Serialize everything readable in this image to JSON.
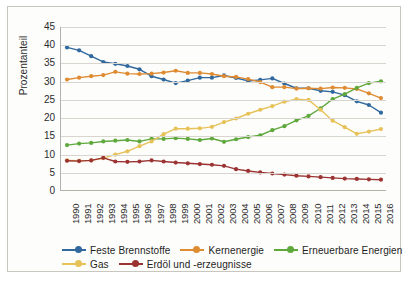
{
  "chart_data": {
    "type": "line",
    "title": "",
    "xlabel": "",
    "ylabel": "Prozentanteil",
    "ylim": [
      0,
      45
    ],
    "ytick_step": 5,
    "yticks": [
      0,
      5,
      10,
      15,
      20,
      25,
      30,
      35,
      40,
      45
    ],
    "grid": true,
    "legend_position": "bottom",
    "categories": [
      "1990",
      "1991",
      "1992",
      "1993",
      "1994",
      "1995",
      "1996",
      "1997",
      "1998",
      "1999",
      "2000",
      "2001",
      "2002",
      "2003",
      "2004",
      "2005",
      "2006",
      "2007",
      "2008",
      "2009",
      "2010",
      "2011",
      "2012",
      "2013",
      "2014",
      "2015",
      "2016"
    ],
    "series": [
      {
        "name": "Feste Brennstoffe",
        "color": "#31699E",
        "values": [
          39.4,
          38.6,
          37.0,
          35.4,
          34.9,
          34.3,
          33.4,
          31.5,
          30.6,
          29.6,
          30.3,
          31.1,
          31.1,
          31.7,
          31.0,
          30.2,
          30.5,
          30.9,
          29.5,
          28.2,
          28.2,
          27.5,
          27.2,
          26.3,
          24.6,
          23.6,
          21.5
        ]
      },
      {
        "name": "Kernenergie",
        "color": "#DF8B32",
        "values": [
          30.6,
          31.1,
          31.5,
          31.8,
          32.7,
          32.2,
          32.1,
          32.2,
          32.5,
          33.0,
          32.4,
          32.4,
          32.1,
          31.5,
          31.3,
          30.7,
          29.9,
          28.5,
          28.5,
          28.1,
          28.2,
          28.1,
          28.4,
          28.3,
          28.0,
          26.8,
          25.5
        ]
      },
      {
        "name": "Erneuerbare Energien",
        "color": "#5FA83C",
        "values": [
          12.6,
          13.0,
          13.2,
          13.6,
          13.8,
          14.0,
          13.6,
          14.3,
          14.3,
          14.5,
          14.3,
          14.0,
          14.4,
          13.5,
          14.2,
          14.8,
          15.3,
          16.7,
          17.8,
          19.4,
          20.6,
          22.7,
          25.2,
          26.6,
          28.3,
          29.6,
          30.1
        ]
      },
      {
        "name": "Gas",
        "color": "#E7C259",
        "values": [
          8.4,
          8.3,
          8.4,
          9.0,
          10.0,
          10.9,
          12.3,
          13.6,
          15.6,
          17.1,
          17.1,
          17.2,
          17.6,
          18.9,
          19.9,
          21.2,
          22.3,
          23.3,
          24.5,
          25.2,
          25.0,
          22.3,
          19.3,
          17.5,
          15.7,
          16.3,
          17.0
        ]
      },
      {
        "name": "Erdöl und -erzeugnisse",
        "color": "#9C3333",
        "values": [
          8.3,
          8.2,
          8.4,
          9.1,
          8.1,
          8.0,
          8.1,
          8.4,
          8.1,
          7.8,
          7.6,
          7.4,
          7.2,
          6.9,
          6.0,
          5.5,
          5.1,
          4.8,
          4.5,
          4.2,
          4.0,
          3.8,
          3.6,
          3.4,
          3.3,
          3.2,
          3.1
        ]
      }
    ]
  },
  "axis": {
    "ylabel": "Prozentanteil"
  },
  "legend": {
    "rows": [
      [
        {
          "label": "Feste Brennstoffe",
          "color": "#31699E"
        },
        {
          "label": "Kernenergie",
          "color": "#DF8B32"
        },
        {
          "label": "Erneuerbare Energien",
          "color": "#5FA83C"
        }
      ],
      [
        {
          "label": "Gas",
          "color": "#E7C259"
        },
        {
          "label": "Erdöl und -erzeugnisse",
          "color": "#9C3333"
        }
      ]
    ]
  }
}
